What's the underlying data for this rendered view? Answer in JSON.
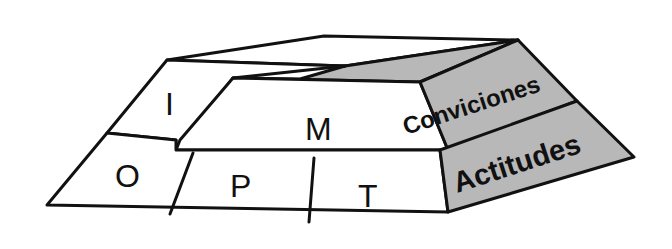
{
  "diagram": {
    "type": "3d-layered-block",
    "colors": {
      "outline": "#111111",
      "front_faces": "#ffffff",
      "side_faces": "#b8b8b8"
    },
    "top_layer": {
      "blocks": [
        {
          "id": "I",
          "label": "I"
        },
        {
          "id": "M",
          "label": "M"
        }
      ],
      "side_label": "Conviciones"
    },
    "bottom_layer": {
      "blocks": [
        {
          "id": "O",
          "label": "O"
        },
        {
          "id": "P",
          "label": "P"
        },
        {
          "id": "T",
          "label": "T"
        }
      ],
      "side_label": "Actitudes"
    }
  }
}
